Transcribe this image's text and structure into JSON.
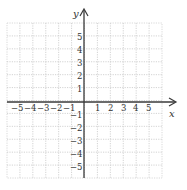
{
  "chart_data": {
    "type": "scatter",
    "title": "",
    "xlabel": "x",
    "ylabel": "y",
    "xlim": [
      -6,
      6
    ],
    "ylim": [
      -6,
      6
    ],
    "grid": true,
    "x_ticks": [
      "-5",
      "-4",
      "-3",
      "-2",
      "-1",
      "1",
      "2",
      "3",
      "4",
      "5"
    ],
    "y_ticks": [
      "5",
      "4",
      "3",
      "2",
      "1",
      "-1",
      "-2",
      "-3",
      "-4",
      "-5"
    ],
    "series": []
  },
  "labels": {
    "x_axis": "x",
    "y_axis": "y",
    "x_neg": [
      "−5",
      "−4",
      "−3",
      "−2",
      "−1"
    ],
    "x_pos": [
      "1",
      "2",
      "3",
      "4",
      "5"
    ],
    "y_pos": [
      "5",
      "4",
      "3",
      "2",
      "1"
    ],
    "y_neg": [
      "−1",
      "−2",
      "−3",
      "−4",
      "−5"
    ]
  },
  "colors": {
    "grid": "#c8c8c8",
    "axis": "#3a3a3a",
    "text": "#333333"
  }
}
